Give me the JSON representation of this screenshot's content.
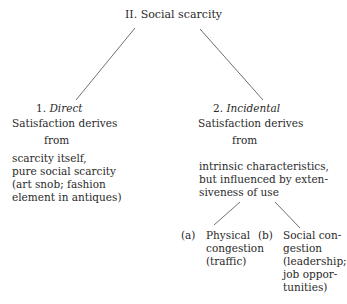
{
  "root": {
    "label": "II. Social scarcity"
  },
  "left": {
    "number": "1.",
    "title": "Direct",
    "line1": "Satisfaction derives",
    "line2": "from",
    "body": [
      "scarcity itself,",
      "pure social scarcity",
      "(art snob; fashion",
      "element in antiques)"
    ]
  },
  "right": {
    "number": "2.",
    "title": "Incidental",
    "line1": "Satisfaction derives",
    "line2": "from",
    "body": [
      "intrinsic characteristics,",
      "but influenced by exten-",
      "siveness of use"
    ],
    "sub_a": {
      "marker": "(a)",
      "lines": [
        "Physical",
        "congestion",
        "(traffic)"
      ]
    },
    "sub_b": {
      "marker": "(b)",
      "lines": [
        "Social con-",
        "gestion",
        "(leadership;",
        "job oppor-",
        "tunities)"
      ]
    }
  },
  "colors": {
    "line": "#707070",
    "text": "#2a2a2a"
  }
}
